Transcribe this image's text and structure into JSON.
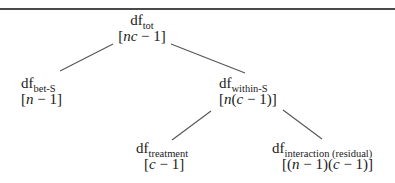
{
  "diagram": {
    "nodes": {
      "total": {
        "base": "df",
        "sub": "tot",
        "formula_open": "[",
        "formula_var": "nc",
        "formula_rest": " − 1]"
      },
      "between_subjects": {
        "base": "df",
        "sub": "bet-S",
        "formula_open": "[",
        "formula_var": "n",
        "formula_rest": " − 1]"
      },
      "within_subjects": {
        "base": "df",
        "sub": "within-S",
        "formula_open": "[",
        "formula_var": "n",
        "formula_mid": "(",
        "formula_var2": "c",
        "formula_rest": " − 1)]"
      },
      "treatment": {
        "base": "df",
        "sub": "treatment",
        "formula_open": "[",
        "formula_var": "c",
        "formula_rest": " − 1]"
      },
      "interaction": {
        "base": "df",
        "sub": "interaction (residual)",
        "formula_open": "[(",
        "formula_var": "n",
        "formula_mid": " − 1)(",
        "formula_var2": "c",
        "formula_rest": " − 1)]"
      }
    },
    "edges": [
      {
        "from": "total",
        "to": "between_subjects"
      },
      {
        "from": "total",
        "to": "within_subjects"
      },
      {
        "from": "within_subjects",
        "to": "treatment"
      },
      {
        "from": "within_subjects",
        "to": "interaction"
      }
    ],
    "colors": {
      "text": "#1a1a1a",
      "line": "#555555",
      "rule": "#4a4a4a",
      "background": "#ffffff"
    }
  }
}
